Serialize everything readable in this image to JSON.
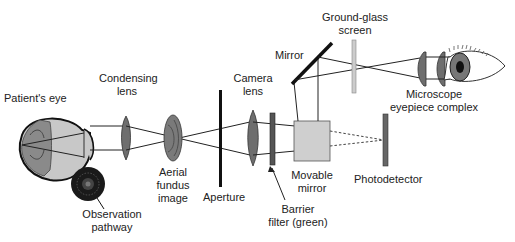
{
  "diagram": {
    "labels": {
      "patients_eye": "Patient's eye",
      "condensing_lens_1": "Condensing",
      "condensing_lens_2": "lens",
      "aerial_fundus_1": "Aerial",
      "aerial_fundus_2": "fundus",
      "aerial_fundus_3": "image",
      "aperture": "Aperture",
      "camera_lens_1": "Camera",
      "camera_lens_2": "lens",
      "mirror": "Mirror",
      "ground_glass_1": "Ground-glass",
      "ground_glass_2": "screen",
      "microscope_1": "Microscope",
      "microscope_2": "eyepiece complex",
      "movable_mirror_1": "Movable",
      "movable_mirror_2": "mirror",
      "photodetector": "Photodetector",
      "barrier_filter_1": "Barrier",
      "barrier_filter_2": "filter (green)",
      "observation_1": "Observation",
      "observation_2": "pathway"
    },
    "colors": {
      "stroke": "#222222",
      "lens_fill": "#6e6e6e",
      "eye_fill": "#c8c8c8",
      "retina_fill": "#8a8a8a",
      "box_fill": "#cfcfcf",
      "screen_fill": "#cccccc",
      "filter_fill": "#555555"
    }
  }
}
